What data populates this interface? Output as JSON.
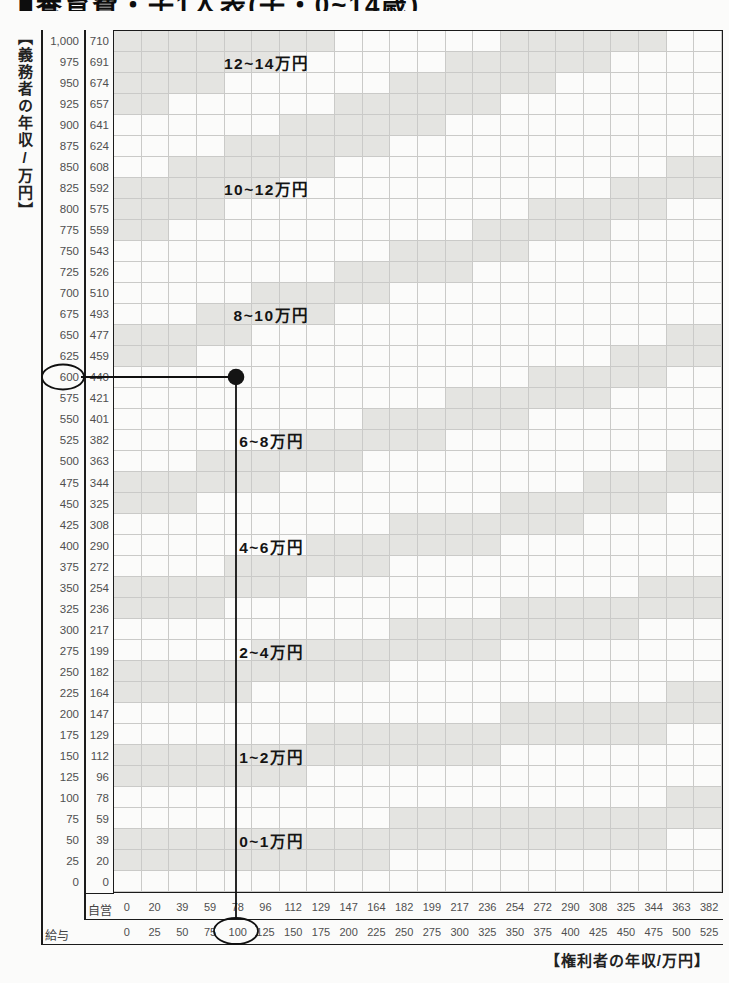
{
  "title_clipped": "■養育費・子1人表(子・0~14歳)",
  "axes": {
    "y_title": "【義務者の年収/万円】",
    "x_title": "【権利者の年収/万円】",
    "self_employed_label": "自営",
    "salary_label": "給与"
  },
  "chart_data": {
    "type": "heatmap",
    "y_axis_salary": [
      "1,000",
      "975",
      "950",
      "925",
      "900",
      "875",
      "850",
      "825",
      "800",
      "775",
      "750",
      "725",
      "700",
      "675",
      "650",
      "625",
      "600",
      "575",
      "550",
      "525",
      "500",
      "475",
      "450",
      "425",
      "400",
      "375",
      "350",
      "325",
      "300",
      "275",
      "250",
      "225",
      "200",
      "175",
      "150",
      "125",
      "100",
      "75",
      "50",
      "25",
      "0"
    ],
    "y_axis_self_employed": [
      "710",
      "691",
      "674",
      "657",
      "641",
      "624",
      "608",
      "592",
      "575",
      "559",
      "543",
      "526",
      "510",
      "493",
      "477",
      "459",
      "440",
      "421",
      "401",
      "382",
      "363",
      "344",
      "325",
      "308",
      "290",
      "272",
      "254",
      "236",
      "217",
      "199",
      "182",
      "164",
      "147",
      "129",
      "112",
      "96",
      "78",
      "59",
      "39",
      "20",
      "0"
    ],
    "x_axis_self_employed": [
      "0",
      "20",
      "39",
      "59",
      "78",
      "96",
      "112",
      "129",
      "147",
      "164",
      "182",
      "199",
      "217",
      "236",
      "254",
      "272",
      "290",
      "308",
      "325",
      "344",
      "363",
      "382"
    ],
    "x_axis_salary": [
      "0",
      "25",
      "50",
      "75",
      "100",
      "125",
      "150",
      "175",
      "200",
      "225",
      "250",
      "275",
      "300",
      "325",
      "350",
      "375",
      "400",
      "425",
      "450",
      "475",
      "500",
      "525"
    ],
    "zone_labels": [
      {
        "text": "12~14万円",
        "row_value": 975,
        "col": 4.0
      },
      {
        "text": "10~12万円",
        "row_value": 825,
        "col": 4.0
      },
      {
        "text": "8~10万円",
        "row_value": 675,
        "col": 4.35
      },
      {
        "text": "6~8万円",
        "row_value": 525,
        "col": 4.55
      },
      {
        "text": "4~6万円",
        "row_value": 400,
        "col": 4.55
      },
      {
        "text": "2~4万円",
        "row_value": 275,
        "col": 4.55
      },
      {
        "text": "1~2万円",
        "row_value": 150,
        "col": 4.55
      },
      {
        "text": "0~1万円",
        "row_value": 50,
        "col": 4.55
      }
    ],
    "boundary_bands": [
      {
        "start": 25,
        "slope": 0.1,
        "rows": 2
      },
      {
        "start": 125,
        "slope": 0.15,
        "rows": 2
      },
      {
        "start": 225,
        "slope": 0.22,
        "rows": 2
      },
      {
        "start": 325,
        "slope": 0.3,
        "rows": 2
      },
      {
        "start": 450,
        "slope": 0.35,
        "rows": 2
      },
      {
        "start": 625,
        "slope": 0.4,
        "rows": 2
      },
      {
        "start": 775,
        "slope": 0.5,
        "rows": 3
      },
      {
        "start": 925,
        "slope": 0.5,
        "rows": 4
      }
    ],
    "highlight_example": {
      "obligor_salary_circled": "600",
      "obligor_self_employed_crossed": "440",
      "rightsholder_salary_circled": "100",
      "marker_col_value": "100",
      "marker_row_value": "600",
      "resulting_zone": "6~8万円"
    },
    "grid_on": true,
    "colors": {
      "shaded_cell": "#e4e4e1",
      "gridline": "#cacac8",
      "border": "#1b1b1b",
      "marker": "#101010"
    }
  }
}
